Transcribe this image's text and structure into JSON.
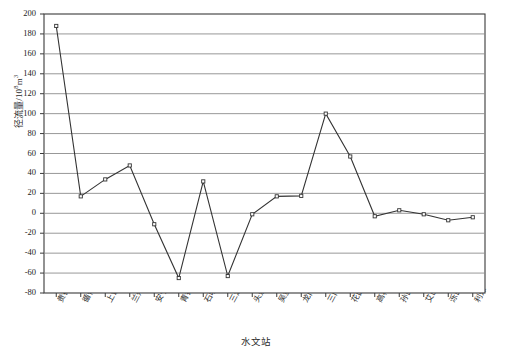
{
  "chart_data": {
    "type": "line",
    "title": "",
    "xlabel": "水文站",
    "ylabel": "径流量/10⁸m³",
    "ylabel_base": "径流量/10",
    "ylabel_exp": "8",
    "ylabel_unit": "m",
    "ylabel_unit_exp": "3",
    "categories": [
      "贵德",
      "循化",
      "上诠",
      "兰州",
      "安宁渡",
      "青铜峡",
      "石嘴山",
      "三湖河口",
      "头道拐",
      "吴堡",
      "龙门",
      "三门峡",
      "花园口",
      "高村",
      "孙口",
      "艾山",
      "泺口",
      "利津"
    ],
    "values": [
      188,
      17,
      34,
      48,
      -11,
      -65,
      32,
      -63,
      -1,
      17,
      17.5,
      100,
      57,
      -3,
      3,
      -1,
      -7,
      -4
    ],
    "ylim": [
      -80,
      200
    ],
    "yticks": [
      200,
      180,
      160,
      140,
      120,
      100,
      80,
      60,
      40,
      20,
      0,
      -20,
      -40,
      -60,
      -80
    ],
    "ytick_labels": [
      "200",
      "180",
      "160",
      "140",
      "120",
      "100",
      "80",
      "60",
      "40",
      "20",
      "0",
      "-20",
      "-40",
      "-60",
      "-80"
    ],
    "grid": true,
    "legend": "none",
    "marker": "square-open",
    "line_color": "#333333",
    "grid_color": "#8c8c8c",
    "axis_color": "#3a3a3a",
    "marker_fill": "#ffffff"
  }
}
